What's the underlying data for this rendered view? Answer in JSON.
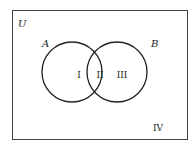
{
  "diagram": {
    "type": "venn",
    "universe_label": "U",
    "sets": [
      {
        "name": "A",
        "label": "A"
      },
      {
        "name": "B",
        "label": "B"
      }
    ],
    "regions": [
      {
        "id": "I",
        "label": "I",
        "description": "A only"
      },
      {
        "id": "II",
        "label": "II",
        "description": "A and B"
      },
      {
        "id": "III",
        "label": "III",
        "description": "B only"
      },
      {
        "id": "IV",
        "label": "IV",
        "description": "outside A and B"
      }
    ],
    "colors": {
      "stroke": "#222222",
      "background": "#ffffff"
    }
  }
}
